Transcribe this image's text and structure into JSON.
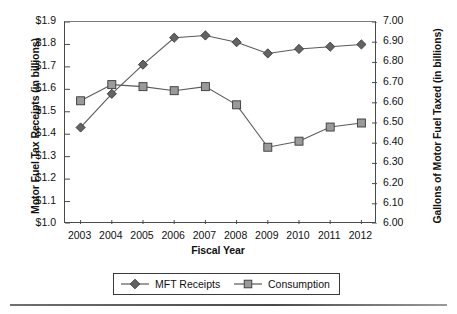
{
  "chart_data": {
    "type": "line",
    "title": "",
    "xlabel": "Fiscal Year",
    "ylabel": "Motor Fuel Tax Receipts (in billions)",
    "y2label": "Gallons of Motor Fuel Taxed (in billions)",
    "categories": [
      "2003",
      "2004",
      "2005",
      "2006",
      "2007",
      "2008",
      "2009",
      "2010",
      "2011",
      "2012"
    ],
    "x": [
      2003,
      2004,
      2005,
      2006,
      2007,
      2008,
      2009,
      2010,
      2011,
      2012
    ],
    "ylim": [
      1.0,
      1.9
    ],
    "y2lim": [
      6.0,
      7.0
    ],
    "ytick_labels": [
      "$1.9",
      "$1.8",
      "$1.7",
      "$1.6",
      "$1.5",
      "$1.4",
      "$1.3",
      "$1.2",
      "$1.1",
      "$1.0"
    ],
    "ytick_values": [
      1.9,
      1.8,
      1.7,
      1.6,
      1.5,
      1.4,
      1.3,
      1.2,
      1.1,
      1.0
    ],
    "y2tick_labels": [
      "7.00",
      "6.90",
      "6.80",
      "6.70",
      "6.60",
      "6.50",
      "6.40",
      "6.30",
      "6.20",
      "6.10",
      "6.00"
    ],
    "y2tick_values": [
      7.0,
      6.9,
      6.8,
      6.7,
      6.6,
      6.5,
      6.4,
      6.3,
      6.2,
      6.1,
      6.0
    ],
    "grid": false,
    "legend_position": "bottom",
    "series": [
      {
        "name": "MFT Receipts",
        "axis": "left",
        "marker": "diamond",
        "color": "#636363",
        "values": [
          1.43,
          1.58,
          1.71,
          1.83,
          1.84,
          1.81,
          1.76,
          1.78,
          1.79,
          1.8
        ]
      },
      {
        "name": "Consumption",
        "axis": "right",
        "marker": "square",
        "color": "#9a9a9a",
        "values": [
          6.61,
          6.69,
          6.68,
          6.66,
          6.68,
          6.59,
          6.38,
          6.41,
          6.48,
          6.5
        ]
      }
    ]
  },
  "legend": {
    "entries": [
      {
        "label": "MFT Receipts"
      },
      {
        "label": "Consumption"
      }
    ]
  },
  "colors": {
    "series_mft": "#636363",
    "series_consumption": "#9a9a9a",
    "line": "#5a5a5a",
    "axis": "#4a4a4a",
    "text": "#111111",
    "background": "#ffffff"
  }
}
